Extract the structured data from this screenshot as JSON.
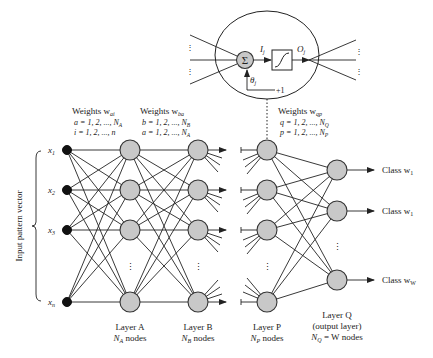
{
  "diagram": {
    "type": "feedforward-neural-network",
    "neuron_detail": {
      "sum_symbol": "Σ",
      "input_label": "I",
      "input_sub": "j",
      "output_label": "O",
      "output_sub": "j",
      "bias_label": "θ",
      "bias_sub": "j",
      "bias_value": "+1",
      "activation": "sigmoid"
    },
    "side_label": "Input pattern vector",
    "inputs": [
      {
        "label": "x",
        "sub": "1"
      },
      {
        "label": "x",
        "sub": "2"
      },
      {
        "label": "x",
        "sub": "3"
      },
      {
        "label": "x",
        "sub": "n"
      }
    ],
    "weights": [
      {
        "title": "Weights w",
        "title_sub": "ai",
        "line1": "a = 1, 2, ..., N",
        "line1_sub": "A",
        "line2": "i = 1, 2, ..., n",
        "line2_sub": ""
      },
      {
        "title": "Weights w",
        "title_sub": "ba",
        "line1": "b = 1, 2, ..., N",
        "line1_sub": "B",
        "line2": "a = 1, 2, ..., N",
        "line2_sub": "A"
      },
      {
        "title": "Weights w",
        "title_sub": "qp",
        "line1": "q = 1, 2, ..., N",
        "line1_sub": "Q",
        "line2": "p = 1, 2, ..., N",
        "line2_sub": "P"
      }
    ],
    "layers": [
      {
        "name": "Layer A",
        "nodes_line": "N",
        "nodes_sub": "A",
        "nodes_suffix": " nodes"
      },
      {
        "name": "Layer B",
        "nodes_line": "N",
        "nodes_sub": "B",
        "nodes_suffix": " nodes"
      },
      {
        "name": "Layer P",
        "nodes_line": "N",
        "nodes_sub": "P",
        "nodes_suffix": " nodes"
      },
      {
        "name": "Layer Q",
        "extra": "(output layer)",
        "nodes_line": "N",
        "nodes_sub": "Q",
        "nodes_suffix": " = W nodes"
      }
    ],
    "outputs": [
      {
        "label": "Class w",
        "sub": "1"
      },
      {
        "label": "Class w",
        "sub": "1"
      },
      {
        "label": "Class w",
        "sub": "W"
      }
    ],
    "ellipsis": "⋮",
    "colors": {
      "node_fill": "#c8c8c8",
      "input_node_fill": "#111111",
      "stroke": "#222222",
      "background": "#ffffff"
    }
  }
}
